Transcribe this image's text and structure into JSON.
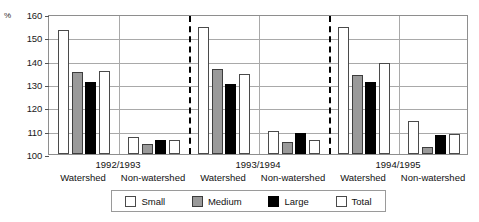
{
  "chart_data": {
    "type": "bar",
    "title": "",
    "xlabel": "",
    "ylabel": "%",
    "ylim": [
      100,
      160
    ],
    "yticks": [
      100,
      110,
      120,
      130,
      140,
      150,
      160
    ],
    "grid": true,
    "legend_position": "bottom",
    "legend": [
      "Small",
      "Medium",
      "Large",
      "Total"
    ],
    "series": [
      {
        "name": "Small",
        "values": [
          153.0,
          107.5,
          154.5,
          110.0,
          154.5,
          114.0
        ]
      },
      {
        "name": "Medium",
        "values": [
          135.0,
          104.5,
          136.5,
          105.0,
          134.0,
          103.0
        ]
      },
      {
        "name": "Large",
        "values": [
          131.0,
          106.0,
          130.0,
          109.0,
          131.0,
          108.0
        ]
      },
      {
        "name": "Total",
        "values": [
          135.5,
          106.0,
          134.5,
          106.0,
          139.0,
          108.5
        ]
      }
    ],
    "categories": [
      "Watershed",
      "Non-watershed",
      "Watershed",
      "Non-watershed",
      "Watershed",
      "Non-watershed"
    ],
    "seasons": [
      "1992/1993",
      "1993/1994",
      "1994/1995"
    ],
    "colors": {
      "small": "#ffffff",
      "medium": "#9a9a9a",
      "large": "#000000",
      "total": "#ffffff",
      "grid": "#a9a9a9",
      "axis": "#8e8e8e"
    }
  }
}
